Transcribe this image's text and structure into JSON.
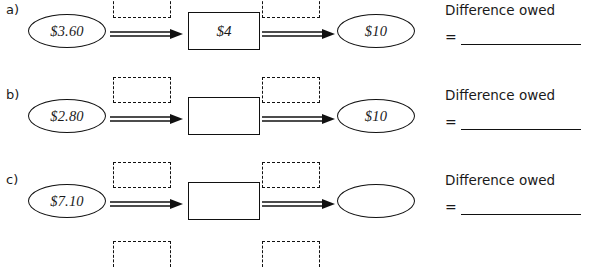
{
  "worksheet": {
    "rows": [
      {
        "label": "a)",
        "start_value": "$3.60",
        "middle_value": "$4",
        "end_value": "$10",
        "difference_label": "Difference owed",
        "equals_sign": "=",
        "answer_value": ""
      },
      {
        "label": "b)",
        "start_value": "$2.80",
        "middle_value": "",
        "end_value": "$10",
        "difference_label": "Difference owed",
        "equals_sign": "=",
        "answer_value": ""
      },
      {
        "label": "c)",
        "start_value": "$7.10",
        "middle_value": "",
        "end_value": "",
        "difference_label": "Difference owed",
        "equals_sign": "=",
        "answer_value": ""
      }
    ],
    "ink_color": "#111111",
    "text_color": "#1a1a1a"
  }
}
